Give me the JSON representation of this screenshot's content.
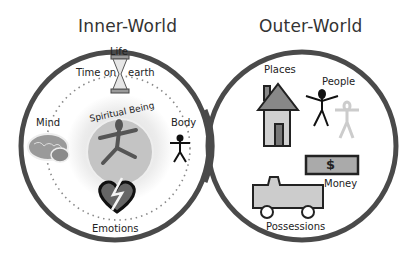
{
  "diagram": {
    "left": {
      "title": "Inner-World",
      "center_label": "Spiritual Being",
      "items": [
        {
          "label": "Life",
          "icon": "hourglass-icon"
        },
        {
          "label": "Time on",
          "icon": ""
        },
        {
          "label": "earth",
          "icon": ""
        },
        {
          "label": "Mind",
          "icon": "brain-icon"
        },
        {
          "label": "Body",
          "icon": "stick-figure-icon"
        },
        {
          "label": "Emotions",
          "icon": "broken-heart-icon"
        }
      ]
    },
    "right": {
      "title": "Outer-World",
      "items": [
        {
          "label": "Places",
          "icon": "house-icon"
        },
        {
          "label": "People",
          "icon": "people-icon"
        },
        {
          "label": "Money",
          "icon": "money-icon"
        },
        {
          "label": "Possessions",
          "icon": "truck-icon"
        }
      ]
    },
    "money_symbol": "$",
    "colors": {
      "ring": "#4a4a4a",
      "fill_gray": "#bdbdbd",
      "dark": "#222222"
    }
  }
}
